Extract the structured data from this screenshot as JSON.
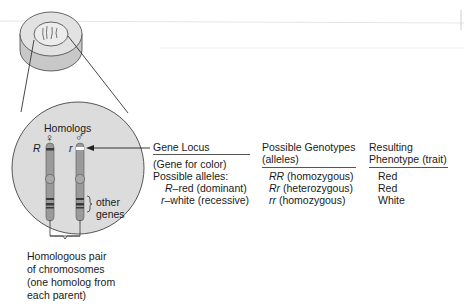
{
  "diagram": {
    "cell_label": "",
    "magnified": {
      "title": "Homologs",
      "female_symbol": "♀",
      "male_symbol": "♂",
      "left_allele": "R",
      "right_allele": "r",
      "other_genes_label_1": "other",
      "other_genes_label_2": "genes"
    },
    "pair_caption": [
      "Homologous pair",
      "of chromosomes",
      "(one homolog from",
      "each parent)"
    ]
  },
  "table": {
    "col1": {
      "header": "Gene Locus",
      "line1": "(Gene for color)",
      "line2": "Possible alleles:",
      "alleles": [
        {
          "symbol": "R",
          "text": "–red (dominant)"
        },
        {
          "symbol": "r",
          "text": "–white (recessive)"
        }
      ]
    },
    "col2": {
      "header_1": "Possible Genotypes",
      "header_2": "(alleles)",
      "rows": [
        {
          "genotype": "RR",
          "desc": " (homozygous)"
        },
        {
          "genotype": "Rr",
          "desc": " (heterozygous)"
        },
        {
          "genotype": "rr",
          "desc": " (homozygous)"
        }
      ]
    },
    "col3": {
      "header_1": "Resulting",
      "header_2": "Phenotype (trait)",
      "rows": [
        "Red",
        "Red",
        "White"
      ]
    }
  },
  "colors": {
    "chromosome": "#9a9a9a",
    "band_dark": "#3a3a3a",
    "circle_fill": "#dcdcdc",
    "locus_band": "#ffffff"
  }
}
